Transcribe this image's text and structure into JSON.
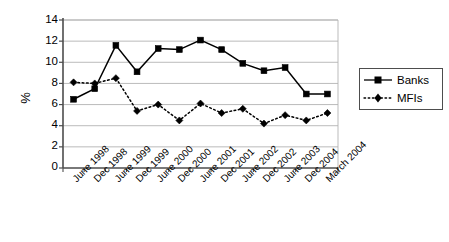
{
  "chart_data": {
    "type": "line",
    "title": "",
    "xlabel": "",
    "ylabel": "%",
    "ylim": [
      0,
      14
    ],
    "yticks": [
      0,
      2,
      4,
      6,
      8,
      10,
      12,
      14
    ],
    "grid": true,
    "legend_position": "right",
    "categories": [
      "June 1998",
      "Dec 1998",
      "June 1999",
      "Dec 1999",
      "June 2000",
      "Dec 2000",
      "June 2001",
      "Dec 2001",
      "June 2002",
      "Dec 2002",
      "June 2003",
      "Dec 2004",
      "March 2004"
    ],
    "series": [
      {
        "name": "Banks",
        "marker": "square",
        "linestyle": "solid",
        "color": "#000000",
        "values": [
          6.5,
          7.5,
          11.6,
          9.1,
          11.3,
          11.2,
          12.1,
          11.2,
          9.9,
          9.2,
          9.5,
          7.0,
          7.0
        ]
      },
      {
        "name": "MFIs",
        "marker": "diamond",
        "linestyle": "dotted",
        "color": "#000000",
        "values": [
          8.1,
          8.0,
          8.5,
          5.4,
          6.0,
          4.5,
          6.1,
          5.2,
          5.6,
          4.2,
          5.0,
          4.5,
          5.2
        ]
      }
    ]
  },
  "axis": {
    "y_label": "%",
    "y_tick_labels": [
      "0",
      "2",
      "4",
      "6",
      "8",
      "10",
      "12",
      "14"
    ]
  },
  "legend": {
    "entries": [
      {
        "label": "Banks"
      },
      {
        "label": "MFIs"
      }
    ]
  },
  "colors": {
    "line": "#000000",
    "grid": "#b3b3b3",
    "axis": "#4d4d4d",
    "background": "#ffffff"
  }
}
